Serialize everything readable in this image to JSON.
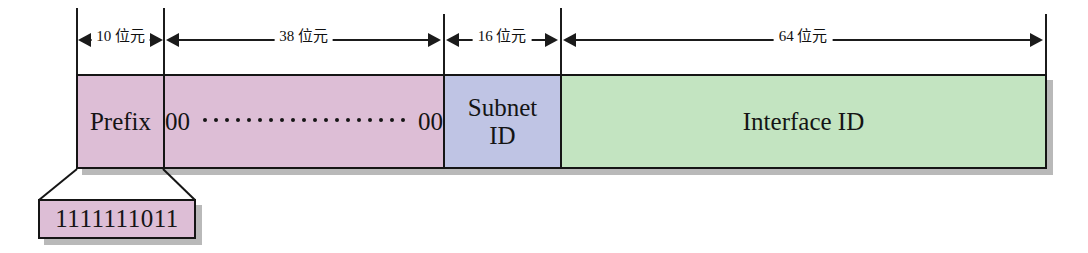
{
  "diagram": {
    "colors": {
      "prefix_fill": "#ddbed6",
      "zeros_fill": "#ddbed6",
      "subnet_fill": "#bfc4e4",
      "interface_fill": "#c3e4c1",
      "outline": "#151515",
      "shadow": "#b9b9b9"
    },
    "dimensions": [
      {
        "label": "10 位元",
        "bits": 10,
        "field": "Prefix"
      },
      {
        "label": "38 位元",
        "bits": 38,
        "field": "00 ... 00"
      },
      {
        "label": "16 位元",
        "bits": 16,
        "field": "Subnet ID"
      },
      {
        "label": "64 位元",
        "bits": 64,
        "field": "Interface ID"
      }
    ],
    "fields": [
      {
        "label": "Prefix",
        "label_line1": "Prefix",
        "label_line2": ""
      },
      {
        "label": "00 00",
        "label_line1": "00",
        "label_line2": "00",
        "dot_count": 19
      },
      {
        "label": "Subnet ID",
        "label_line1": "Subnet",
        "label_line2": "ID"
      },
      {
        "label": "Interface ID",
        "label_line1": "Interface ID",
        "label_line2": ""
      }
    ],
    "callout": {
      "value": "1111111011",
      "describes": "Prefix"
    }
  }
}
